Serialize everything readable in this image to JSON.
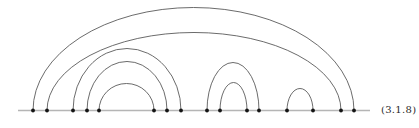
{
  "figure": {
    "label": "(3.1.8)",
    "width": 419,
    "height": 128,
    "baseline": {
      "x1": 18,
      "x2": 370,
      "y": 110.5,
      "color": "#b5b5b5",
      "stroke_width": 1.4
    },
    "points": [
      33,
      47,
      73,
      87,
      99,
      154,
      167,
      181,
      207,
      220,
      247,
      259,
      287,
      313,
      341,
      354
    ],
    "point_color": "#141414",
    "point_radius": 1.9,
    "arcs": [
      {
        "from": 33,
        "to": 354,
        "height": 103
      },
      {
        "from": 47,
        "to": 341,
        "height": 78
      },
      {
        "from": 73,
        "to": 181,
        "height": 62
      },
      {
        "from": 87,
        "to": 167,
        "height": 49
      },
      {
        "from": 99,
        "to": 154,
        "height": 27
      },
      {
        "from": 207,
        "to": 259,
        "height": 48
      },
      {
        "from": 220,
        "to": 247,
        "height": 28
      },
      {
        "from": 287,
        "to": 313,
        "height": 22
      }
    ],
    "arc_color": "#5a5a5a",
    "arc_stroke_width": 0.9
  }
}
